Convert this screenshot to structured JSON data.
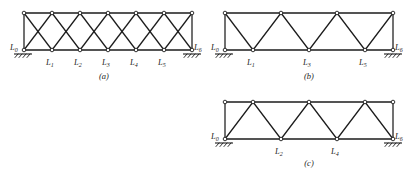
{
  "figure": {
    "background_color": "#ffffff",
    "line_color": "#1c1c1c",
    "panels": [
      {
        "id": "a",
        "caption": "(a)",
        "truss_type": "double-diagonal X-braced truss",
        "span_panels": 6,
        "bottom_nodes": [
          "L0",
          "L1",
          "L2",
          "L3",
          "L4",
          "L5",
          "L6"
        ],
        "bottom_labels": [
          {
            "base": "L",
            "sub": "0"
          },
          {
            "base": "L",
            "sub": "1"
          },
          {
            "base": "L",
            "sub": "2"
          },
          {
            "base": "L",
            "sub": "3"
          },
          {
            "base": "L",
            "sub": "4"
          },
          {
            "base": "L",
            "sub": "5"
          },
          {
            "base": "L",
            "sub": "6"
          }
        ],
        "top_node_count": 7,
        "supports": [
          "hatched-ground-left",
          "hatched-ground-right"
        ]
      },
      {
        "id": "b",
        "caption": "(b)",
        "truss_type": "Warren truss with end posts, apexes over odd panels",
        "span_panels": 6,
        "bottom_nodes": [
          "L0",
          "L1",
          "L3",
          "L5",
          "L6"
        ],
        "bottom_labels": [
          {
            "base": "L",
            "sub": "0"
          },
          {
            "base": "L",
            "sub": "1"
          },
          {
            "base": "L",
            "sub": "3"
          },
          {
            "base": "L",
            "sub": "5"
          },
          {
            "base": "L",
            "sub": "6"
          }
        ],
        "top_node_count": 4,
        "supports": [
          "hatched-ground-left",
          "hatched-ground-right"
        ]
      },
      {
        "id": "c",
        "caption": "(c)",
        "truss_type": "Warren truss with right end post, apexes over even panels",
        "span_panels": 6,
        "bottom_nodes": [
          "L0",
          "L2",
          "L4",
          "L6"
        ],
        "bottom_labels": [
          {
            "base": "L",
            "sub": "0"
          },
          {
            "base": "L",
            "sub": "2"
          },
          {
            "base": "L",
            "sub": "4"
          },
          {
            "base": "L",
            "sub": "6"
          }
        ],
        "top_node_count": 5,
        "supports": [
          "hatched-ground-left",
          "hatched-ground-right"
        ]
      }
    ]
  }
}
